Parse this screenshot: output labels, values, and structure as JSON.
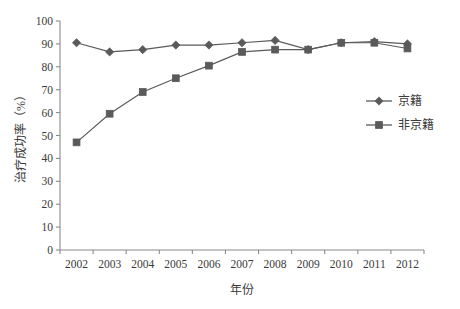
{
  "chart_data": {
    "type": "line",
    "title": "",
    "xlabel": "年份",
    "ylabel": "治疗成功率（%）",
    "categories": [
      "2002",
      "2003",
      "2004",
      "2005",
      "2006",
      "2007",
      "2008",
      "2009",
      "2010",
      "2011",
      "2012"
    ],
    "x": [
      2002,
      2003,
      2004,
      2005,
      2006,
      2007,
      2008,
      2009,
      2010,
      2011,
      2012
    ],
    "series": [
      {
        "name": "京籍",
        "marker": "diamond",
        "color": "#5a5a5a",
        "values": [
          90.5,
          86.5,
          87.5,
          89.5,
          89.5,
          90.5,
          91.5,
          87.5,
          90.5,
          91.0,
          90.0
        ]
      },
      {
        "name": "非京籍",
        "marker": "square",
        "color": "#5a5a5a",
        "values": [
          47.0,
          59.5,
          69.0,
          75.0,
          80.5,
          86.5,
          87.5,
          87.5,
          90.5,
          90.5,
          88.0
        ]
      }
    ],
    "ylim": [
      0,
      100
    ],
    "yticks": [
      0,
      10,
      20,
      30,
      40,
      50,
      60,
      70,
      80,
      90,
      100
    ],
    "ytick_labels": [
      "0",
      "10",
      "20",
      "30",
      "40",
      "50",
      "60",
      "70",
      "80",
      "90",
      "100"
    ],
    "grid": false,
    "legend_position": "right",
    "legend_entries": [
      "京籍",
      "非京籍"
    ]
  },
  "axes": {
    "axis_color": "#8a8a8a",
    "background": "#ffffff"
  }
}
